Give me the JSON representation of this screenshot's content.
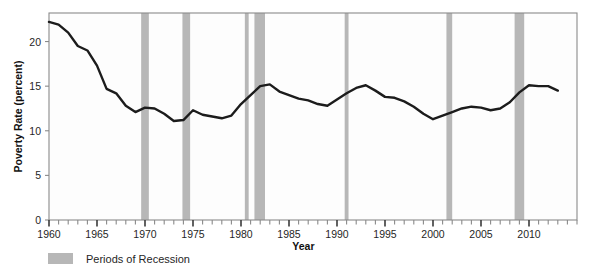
{
  "chart_data": {
    "type": "line",
    "title": "",
    "xlabel": "Year",
    "ylabel": "Poverty Rate (percent)",
    "xlim": [
      1960,
      2015
    ],
    "ylim": [
      0,
      23.2
    ],
    "yticks": [
      0,
      5,
      10,
      15,
      20
    ],
    "ytick_labels": [
      "0",
      "5",
      "10",
      "15",
      "20"
    ],
    "xticks": [
      1960,
      1965,
      1970,
      1975,
      1980,
      1985,
      1990,
      1995,
      2000,
      2005,
      2010
    ],
    "xtick_labels": [
      "1960",
      "1965",
      "1970",
      "1975",
      "1980",
      "1985",
      "1990",
      "1995",
      "2000",
      "2005",
      "2010"
    ],
    "minor_tick_interval": 1,
    "grid": false,
    "legend_position": "below-left",
    "line_color": "#1c1c1c",
    "band_color": "#b7b7b7",
    "axis_color": "#8a8a8a",
    "series": [
      {
        "name": "Poverty Rate",
        "x": [
          1960,
          1961,
          1962,
          1963,
          1964,
          1965,
          1966,
          1967,
          1968,
          1969,
          1970,
          1971,
          1972,
          1973,
          1974,
          1975,
          1976,
          1977,
          1978,
          1979,
          1980,
          1981,
          1982,
          1983,
          1984,
          1985,
          1986,
          1987,
          1988,
          1989,
          1990,
          1991,
          1992,
          1993,
          1994,
          1995,
          1996,
          1997,
          1998,
          1999,
          2000,
          2001,
          2002,
          2003,
          2004,
          2005,
          2006,
          2007,
          2008,
          2009,
          2010,
          2011,
          2012,
          2013
        ],
        "values": [
          22.2,
          21.9,
          21.0,
          19.5,
          19.0,
          17.3,
          14.7,
          14.2,
          12.8,
          12.1,
          12.6,
          12.5,
          11.9,
          11.1,
          11.2,
          12.3,
          11.8,
          11.6,
          11.4,
          11.7,
          13.0,
          14.0,
          15.0,
          15.2,
          14.4,
          14.0,
          13.6,
          13.4,
          13.0,
          12.8,
          13.5,
          14.2,
          14.8,
          15.1,
          14.5,
          13.8,
          13.7,
          13.3,
          12.7,
          11.9,
          11.3,
          11.7,
          12.1,
          12.5,
          12.7,
          12.6,
          12.3,
          12.5,
          13.2,
          14.3,
          15.1,
          15.0,
          15.0,
          14.5
        ]
      }
    ],
    "recession_bands": [
      {
        "label": "1969-1970",
        "start": 1969.6,
        "end": 1970.4
      },
      {
        "label": "1973-1975",
        "start": 1973.9,
        "end": 1974.7
      },
      {
        "label": "1980",
        "start": 1980.4,
        "end": 1980.8
      },
      {
        "label": "1981-1982",
        "start": 1981.4,
        "end": 1982.5
      },
      {
        "label": "1990-1991",
        "start": 1990.8,
        "end": 1991.2
      },
      {
        "label": "2001",
        "start": 2001.4,
        "end": 2002.0
      },
      {
        "label": "2007-2009",
        "start": 2008.5,
        "end": 2009.5
      }
    ]
  },
  "legend": {
    "recession_label": "Periods of Recession",
    "swatch_color": "#b7b7b7"
  }
}
